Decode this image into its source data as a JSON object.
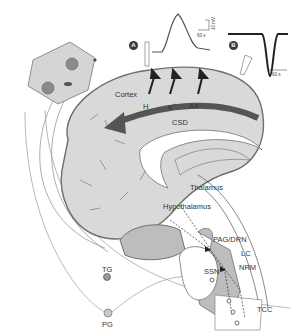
{
  "figure": {
    "panels": [
      {
        "badge": "A",
        "trace": "positive-peak",
        "time_scale": "60 s",
        "amplitude_scale": "10 mV"
      },
      {
        "badge": "B",
        "trace": "negative-dip",
        "time_scale": "60 s"
      }
    ],
    "labels": {
      "cortex": "Cortex",
      "h": "H",
      "k": "K",
      "k_sup": "+",
      "aa": "AA",
      "csd": "CSD",
      "thalamus": "Thalamus",
      "hypothalamus": "Hypothalamus",
      "pag_drn": "PAG/DRN",
      "lc": "LC",
      "nrm": "NRM",
      "ssn": "SSN",
      "tcc": "TCC",
      "tg": "TG",
      "pg": "PG"
    },
    "colors": {
      "brain_fill": "#d9d9d9",
      "brainstem_fill": "#bdbdbd",
      "csd_arrow": "#555555",
      "outline": "#6f6f6f",
      "text": "#333333"
    }
  }
}
